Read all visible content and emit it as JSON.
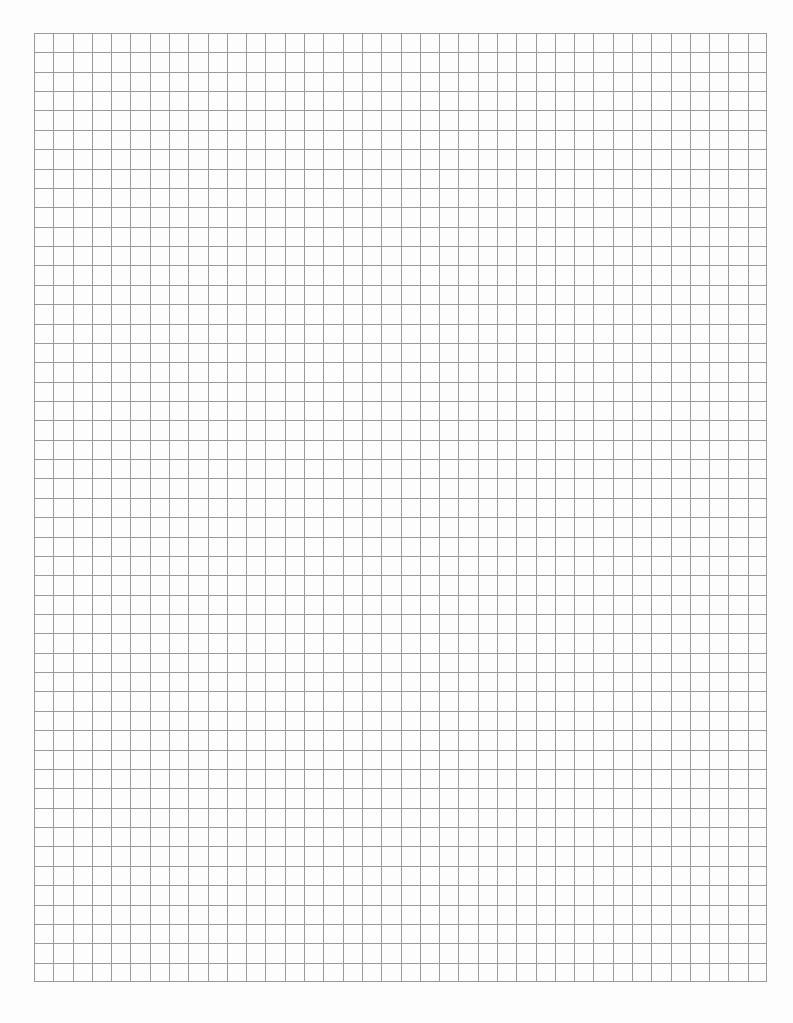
{
  "page": {
    "type": "graph-paper",
    "background_color": "#fdfdfd",
    "line_color": "#9a9a9a"
  },
  "grid": {
    "columns": 38,
    "rows": 49,
    "left": 34,
    "top": 33,
    "width": 733,
    "height": 949,
    "line_width": 1
  }
}
